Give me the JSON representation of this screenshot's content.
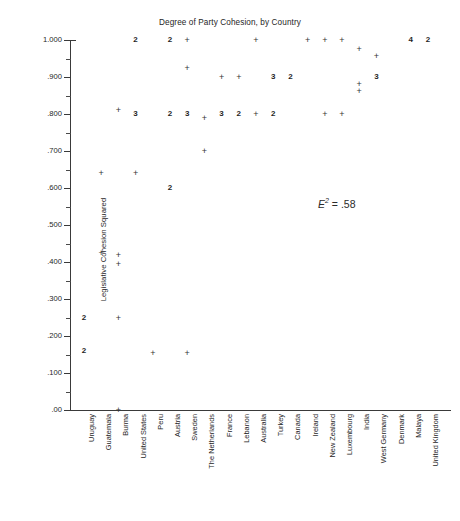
{
  "chart_data": {
    "type": "scatter",
    "title": "Degree of Party Cohesion, by Country",
    "xlabel": "",
    "ylabel": "Legislative Cohesion Squared",
    "ylim": [
      0.0,
      1.0
    ],
    "grid": false,
    "legend": null,
    "annotations": [
      {
        "text_symbol": "E",
        "text_sup": "2",
        "text_value": " =  .58",
        "x_px": 318,
        "y_px": 197
      }
    ],
    "y_ticks": [
      {
        "value": 1.0,
        "label": "1.000"
      },
      {
        "value": 0.9,
        "label": ".900"
      },
      {
        "value": 0.8,
        "label": ".800"
      },
      {
        "value": 0.7,
        "label": ".700"
      },
      {
        "value": 0.6,
        "label": ".600"
      },
      {
        "value": 0.5,
        "label": ".500"
      },
      {
        "value": 0.4,
        "label": ".400"
      },
      {
        "value": 0.3,
        "label": ".300"
      },
      {
        "value": 0.2,
        "label": ".200"
      },
      {
        "value": 0.1,
        "label": ".100"
      },
      {
        "value": 0.0,
        "label": ".00"
      }
    ],
    "categories": [
      "Uruguay",
      "Guatemala",
      "Burma",
      "United States",
      "Peru",
      "Austria",
      "Sweden",
      "The Netherlands",
      "France",
      "Lebanon",
      "Australia",
      "Turkey",
      "Canada",
      "Ireland",
      "New Zealand",
      "Luxembourg",
      "India",
      "West Germany",
      "Denmark",
      "Malaya",
      "United Kingdom"
    ],
    "marker_note": "A '+' denotes one observation; a digit denotes that many overlapping observations at that point.",
    "points": [
      {
        "country": "Uruguay",
        "y": 0.25,
        "marker": "2",
        "count": 2
      },
      {
        "country": "Uruguay",
        "y": 0.16,
        "marker": "2",
        "count": 2
      },
      {
        "country": "Guatemala",
        "y": 0.64,
        "marker": "+",
        "count": 1
      },
      {
        "country": "Guatemala",
        "y": 0.425,
        "marker": "+",
        "count": 1
      },
      {
        "country": "Burma",
        "y": 0.81,
        "marker": "+",
        "count": 1
      },
      {
        "country": "Burma",
        "y": 0.42,
        "marker": "+",
        "count": 1
      },
      {
        "country": "Burma",
        "y": 0.395,
        "marker": "+",
        "count": 1
      },
      {
        "country": "Burma",
        "y": 0.25,
        "marker": "+",
        "count": 1
      },
      {
        "country": "Burma",
        "y": 0.0,
        "marker": "+",
        "count": 1
      },
      {
        "country": "United States",
        "y": 1.0,
        "marker": "2",
        "count": 2
      },
      {
        "country": "United States",
        "y": 0.8,
        "marker": "3",
        "count": 3
      },
      {
        "country": "United States",
        "y": 0.64,
        "marker": "+",
        "count": 1
      },
      {
        "country": "Peru",
        "y": 0.155,
        "marker": "+",
        "count": 1
      },
      {
        "country": "Austria",
        "y": 1.0,
        "marker": "2",
        "count": 2
      },
      {
        "country": "Austria",
        "y": 0.8,
        "marker": "2",
        "count": 2
      },
      {
        "country": "Austria",
        "y": 0.6,
        "marker": "2",
        "count": 2
      },
      {
        "country": "Sweden",
        "y": 1.0,
        "marker": "+",
        "count": 1
      },
      {
        "country": "Sweden",
        "y": 0.925,
        "marker": "+",
        "count": 1
      },
      {
        "country": "Sweden",
        "y": 0.8,
        "marker": "3",
        "count": 3
      },
      {
        "country": "Sweden",
        "y": 0.155,
        "marker": "+",
        "count": 1
      },
      {
        "country": "The Netherlands",
        "y": 0.79,
        "marker": "+",
        "count": 1
      },
      {
        "country": "The Netherlands",
        "y": 0.7,
        "marker": "+",
        "count": 1
      },
      {
        "country": "France",
        "y": 0.9,
        "marker": "+",
        "count": 1
      },
      {
        "country": "France",
        "y": 0.8,
        "marker": "3",
        "count": 3
      },
      {
        "country": "Lebanon",
        "y": 0.9,
        "marker": "+",
        "count": 1
      },
      {
        "country": "Lebanon",
        "y": 0.8,
        "marker": "2",
        "count": 2
      },
      {
        "country": "Australia",
        "y": 1.0,
        "marker": "+",
        "count": 1
      },
      {
        "country": "Australia",
        "y": 0.8,
        "marker": "+",
        "count": 1
      },
      {
        "country": "Turkey",
        "y": 0.9,
        "marker": "3",
        "count": 3
      },
      {
        "country": "Turkey",
        "y": 0.8,
        "marker": "2",
        "count": 2
      },
      {
        "country": "Canada",
        "y": 0.9,
        "marker": "2",
        "count": 2
      },
      {
        "country": "Ireland",
        "y": 1.0,
        "marker": "+",
        "count": 1
      },
      {
        "country": "New Zealand",
        "y": 1.0,
        "marker": "+",
        "count": 1
      },
      {
        "country": "New Zealand",
        "y": 0.8,
        "marker": "+",
        "count": 1
      },
      {
        "country": "Luxembourg",
        "y": 1.0,
        "marker": "+",
        "count": 1
      },
      {
        "country": "Luxembourg",
        "y": 0.8,
        "marker": "+",
        "count": 1
      },
      {
        "country": "India",
        "y": 0.975,
        "marker": "+",
        "count": 1
      },
      {
        "country": "India",
        "y": 0.88,
        "marker": "+",
        "count": 1
      },
      {
        "country": "India",
        "y": 0.862,
        "marker": "+",
        "count": 1
      },
      {
        "country": "West Germany",
        "y": 0.958,
        "marker": "+",
        "count": 1
      },
      {
        "country": "West Germany",
        "y": 0.9,
        "marker": "3",
        "count": 3
      },
      {
        "country": "Malaya",
        "y": 1.0,
        "marker": "4",
        "count": 4
      },
      {
        "country": "United Kingdom",
        "y": 1.0,
        "marker": "2",
        "count": 2
      }
    ]
  }
}
